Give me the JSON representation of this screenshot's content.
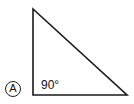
{
  "diagram": {
    "type": "right-triangle",
    "option_label": "A",
    "angle_label": "90°",
    "vertices": {
      "top": [
        33,
        9
      ],
      "right_angle": [
        33,
        95
      ],
      "right": [
        127,
        95
      ]
    },
    "stroke_color": "#1a1a1a"
  }
}
